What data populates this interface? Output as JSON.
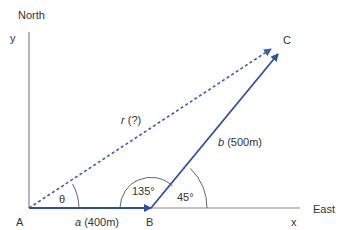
{
  "labels": {
    "north": "North",
    "east": "East",
    "y_axis": "y",
    "x_axis": "x",
    "point_a": "A",
    "point_b": "B",
    "point_c": "C",
    "theta": "θ",
    "angle_135": "135°",
    "angle_45": "45°",
    "vector_a_sym": "a",
    "vector_a_val": " (400m)",
    "vector_b_sym": "b",
    "vector_b_val": " (500m)",
    "vector_r_sym": "r",
    "vector_r_val": " (?)"
  },
  "colors": {
    "axis": "#888888",
    "vector": "#2e4fa3",
    "resultant": "#3a5db8",
    "arc": "#555555",
    "text": "#333333"
  },
  "vectors": [
    {
      "name": "a",
      "from": "A",
      "to": "B",
      "magnitude_m": 400,
      "direction": "East"
    },
    {
      "name": "b",
      "from": "B",
      "to": "C",
      "magnitude_m": 500,
      "angle_deg": 45
    },
    {
      "name": "r",
      "from": "A",
      "to": "C",
      "magnitude": "?",
      "style": "dashed"
    }
  ]
}
